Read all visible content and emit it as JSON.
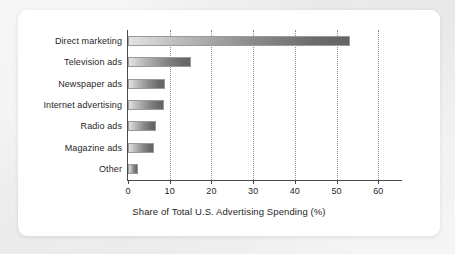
{
  "chart_data": {
    "type": "bar",
    "orientation": "horizontal",
    "title": "",
    "xlabel": "Share of Total U.S. Advertising Spending (%)",
    "ylabel": "",
    "categories": [
      "Direct marketing",
      "Television ads",
      "Newspaper ads",
      "Internet advertising",
      "Radio ads",
      "Magazine ads",
      "Other"
    ],
    "values": [
      53.3,
      15.1,
      8.8,
      8.6,
      6.7,
      6.2,
      2.4
    ],
    "xlim": [
      0,
      61.6
    ],
    "xticks": [
      0,
      10,
      20,
      30,
      40,
      50,
      60
    ],
    "xticklabels": [
      "0",
      "10",
      "20",
      "30",
      "40",
      "50",
      "60"
    ],
    "grid": "vertical-dotted",
    "legend": "none",
    "bar_gradient": [
      "#e3e3e3",
      "#636363"
    ],
    "axis_color": "#4a4a4a",
    "gridline_color": "#8f8f8f",
    "text_color": "#1f1f1f",
    "card_background": "#ffffff",
    "page_background": "#e8e8e8"
  }
}
